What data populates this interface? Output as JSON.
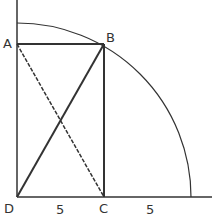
{
  "diagram": {
    "points": {
      "A": {
        "label": "A",
        "x": 17,
        "y": 44
      },
      "B": {
        "label": "B",
        "x": 104,
        "y": 44
      },
      "C": {
        "label": "C",
        "x": 104,
        "y": 197
      },
      "D": {
        "label": "D",
        "x": 17,
        "y": 197
      }
    },
    "segment_labels": {
      "DC": "5",
      "C_to_arc": "5"
    },
    "arc": {
      "center": "D",
      "radius": 174
    },
    "colors": {
      "stroke": "#333333",
      "background": "#ffffff"
    }
  }
}
